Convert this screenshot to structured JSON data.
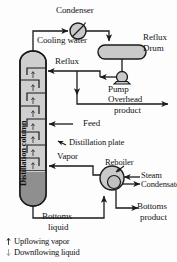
{
  "diagram": {
    "type": "process-flow-diagram",
    "colors": {
      "line": "#1a1a1a",
      "vessel_fill": "#d2d2d2",
      "vessel_fill_light": "#cfcfcf",
      "liquid_pool": "#8c8c8c",
      "equipment_fill": "#c9c9c9",
      "text": "#141414",
      "background": "#fdfdfd"
    }
  },
  "equipment": {
    "column_label": "Distillation column",
    "condenser_label": "Condenser",
    "reflux_drum_label_line1": "Reflux",
    "reflux_drum_label_line2": "Drum",
    "pump_label": "Pump",
    "reboiler_label": "Reboiler"
  },
  "streams": {
    "cooling_water": "Cooling water",
    "reflux": "Reflux",
    "overhead_product_line1": "Overhead",
    "overhead_product_line2": "product",
    "feed": "Feed",
    "distillation_plate": "Distillation plate",
    "vapor": "Vapor",
    "steam": "Steam",
    "condensate": "Condensate",
    "bottoms_liquid_line1": "Bottoms",
    "bottoms_liquid_line2": "liquid",
    "bottoms_product_line1": "Bottoms",
    "bottoms_product_line2": "product"
  },
  "legend": {
    "items": [
      {
        "glyph": "upflowing-vapor-arrow",
        "label": "Upflowing vapor"
      },
      {
        "glyph": "downflowing-liquid-arrow",
        "label": "Downflowing liquid"
      }
    ]
  }
}
